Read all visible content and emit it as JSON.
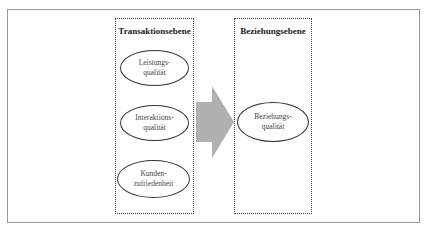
{
  "diagram": {
    "left_column": {
      "title": "Transaktionsebene",
      "items": [
        {
          "line1": "Leistungs-",
          "line2": "qualität"
        },
        {
          "line1": "Interaktions-",
          "line2": "qualität"
        },
        {
          "line1": "Kunden-",
          "line2": "zufriedenheit"
        }
      ]
    },
    "right_column": {
      "title": "Beziehungsebene",
      "items": [
        {
          "line1": "Beziehungs-",
          "line2": "qualität"
        }
      ]
    },
    "arrow": {
      "direction": "right",
      "color": "#b0b0b0"
    }
  }
}
